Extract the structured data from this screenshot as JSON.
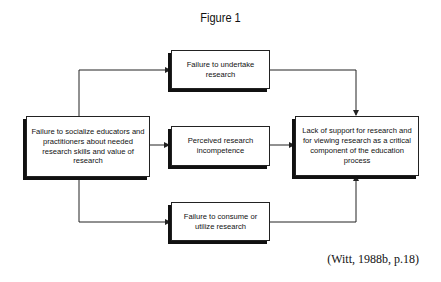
{
  "figure": {
    "title": "Figure 1",
    "citation": "(Witt, 1988b, p.18)"
  },
  "nodes": {
    "source": "Failure to socialize educators and practitioners about needed research skills and value of research",
    "top": "Failure to undertake research",
    "middle": "Perceived research incompetence",
    "bottom": "Failure to consume or utilize research",
    "outcome": "Lack of support for research and for viewing research as a critical component of the education process"
  },
  "edges": [
    {
      "from": "source",
      "to": "top"
    },
    {
      "from": "source",
      "to": "middle"
    },
    {
      "from": "source",
      "to": "bottom"
    },
    {
      "from": "top",
      "to": "outcome"
    },
    {
      "from": "middle",
      "to": "outcome"
    },
    {
      "from": "bottom",
      "to": "outcome"
    }
  ],
  "colors": {
    "line": "#222222",
    "shadow": "#111111",
    "background": "#ffffff"
  }
}
